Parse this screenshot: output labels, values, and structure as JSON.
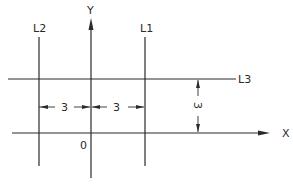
{
  "diagram": {
    "axes": {
      "x_label": "X",
      "y_label": "Y",
      "origin_label": "0"
    },
    "lines": [
      {
        "id": "L1",
        "label": "L1",
        "orientation": "vertical",
        "position": "x = 3"
      },
      {
        "id": "L2",
        "label": "L2",
        "orientation": "vertical",
        "position": "x = -3"
      },
      {
        "id": "L3",
        "label": "L3",
        "orientation": "horizontal",
        "position": "y = 3"
      }
    ],
    "dimensions": [
      {
        "id": "dim-l2-to-y",
        "value": "3",
        "between": "L2 and Y axis"
      },
      {
        "id": "dim-y-to-l1",
        "value": "3",
        "between": "Y axis and L1"
      },
      {
        "id": "dim-x-to-l3",
        "value": "3",
        "between": "X axis and L3"
      }
    ],
    "colors": {
      "ink": "#2a2a2a",
      "background": "#ffffff"
    }
  }
}
